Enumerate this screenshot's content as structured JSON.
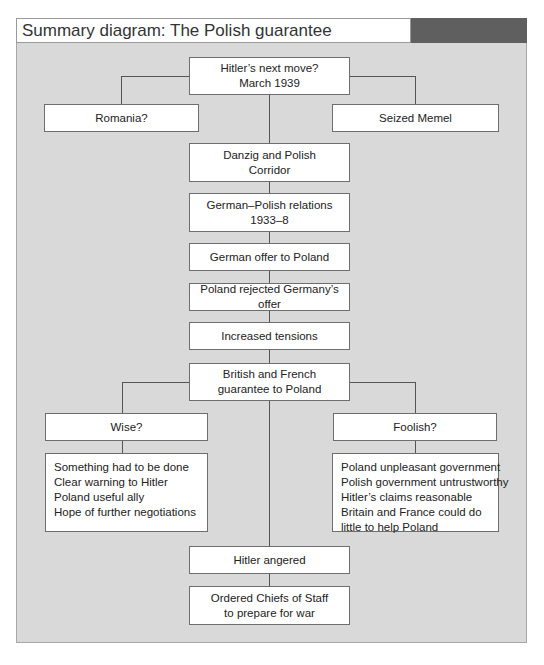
{
  "title": "Summary diagram: The Polish guarantee",
  "colors": {
    "panel_bg": "#d9d9d9",
    "title_accent": "#5f5f5f",
    "box_bg": "#ffffff",
    "line": "#555555"
  },
  "nodes": {
    "top": [
      "Hitler’s next move?",
      "March 1939"
    ],
    "romania": "Romania?",
    "memel": "Seized Memel",
    "danzig": [
      "Danzig and Polish",
      "Corridor"
    ],
    "relations": [
      "German–Polish relations",
      "1933–8"
    ],
    "offer": "German offer to Poland",
    "rejected": "Poland rejected Germany’s offer",
    "tensions": "Increased tensions",
    "guarantee": [
      "British and French",
      "guarantee to Poland"
    ],
    "wise": "Wise?",
    "foolish": "Foolish?",
    "wise_reasons": [
      "Something had to be done",
      "Clear warning to Hitler",
      "Poland useful ally",
      "Hope of further negotiations"
    ],
    "foolish_reasons": [
      "Poland unpleasant government",
      "Polish government untrustworthy",
      "Hitler’s claims reasonable",
      "Britain and France could do",
      "little to help Poland"
    ],
    "angered": "Hitler angered",
    "ordered": [
      "Ordered Chiefs of Staff",
      "to prepare for war"
    ]
  }
}
